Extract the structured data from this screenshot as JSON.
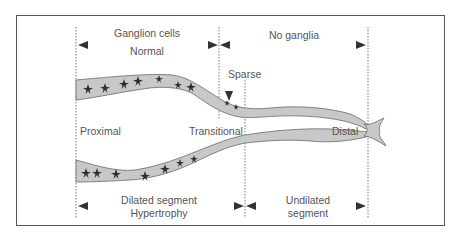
{
  "labels": {
    "top_left_line1": "Ganglion cells",
    "top_left_line2": "Normal",
    "top_right": "No ganglia",
    "sparse": "Sparse",
    "proximal": "Proximal",
    "transitional": "Transitional",
    "distal": "Distal",
    "bottom_left_line1": "Dilated segment",
    "bottom_left_line2": "Hypertrophy",
    "bottom_right_line1": "Undilated",
    "bottom_right_line2": "segment"
  },
  "colors": {
    "bowel_fill": "#c8c8c8",
    "bowel_stroke": "#6a6a6a",
    "cells": "#2e2e2e",
    "arrows": "#333333",
    "text": "#555555",
    "frame": "#555555"
  }
}
